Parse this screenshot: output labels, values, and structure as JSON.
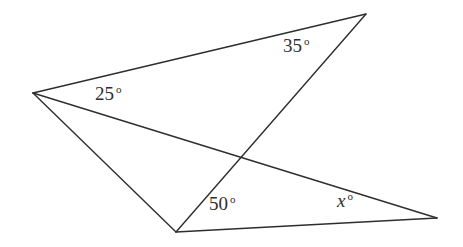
{
  "figure": {
    "type": "geometry-diagram",
    "width": 463,
    "height": 247,
    "background_color": "#ffffff",
    "stroke_color": "#2e2e2e",
    "text_color": "#2e2e2e",
    "stroke_width": 1.4
  },
  "points": {
    "left_vertex": {
      "name": "L",
      "x": 33,
      "y": 93
    },
    "top_right_vertex": {
      "name": "T",
      "x": 366,
      "y": 14
    },
    "bottom_vertex": {
      "name": "B",
      "x": 176,
      "y": 232
    },
    "right_vertex": {
      "name": "R",
      "x": 437,
      "y": 218
    },
    "crossing_point": {
      "name": "X",
      "x": 238,
      "y": 157
    }
  },
  "segments": [
    {
      "id": "seg-left-to-topright",
      "from": "left_vertex",
      "to": "top_right_vertex"
    },
    {
      "id": "seg-left-to-right",
      "from": "left_vertex",
      "to": "right_vertex"
    },
    {
      "id": "seg-left-to-bottom",
      "from": "left_vertex",
      "to": "bottom_vertex"
    },
    {
      "id": "seg-bottom-to-topright",
      "from": "bottom_vertex",
      "to": "top_right_vertex"
    },
    {
      "id": "seg-bottom-to-right",
      "from": "bottom_vertex",
      "to": "right_vertex"
    }
  ],
  "labels": {
    "angle_25": {
      "value": "25",
      "degree": "o",
      "x": 95,
      "y": 84,
      "at_vertex": "left_vertex"
    },
    "angle_35": {
      "value": "35",
      "degree": "o",
      "x": 283,
      "y": 36,
      "at_vertex": "top_right_vertex"
    },
    "angle_50": {
      "value": "50",
      "degree": "o",
      "x": 209,
      "y": 194,
      "at_vertex": "bottom_vertex"
    },
    "angle_x": {
      "value": "x",
      "degree": "o",
      "x": 337,
      "y": 191,
      "at_vertex": "right_vertex"
    }
  }
}
